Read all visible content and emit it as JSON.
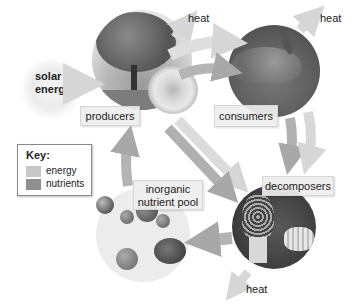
{
  "diagram": {
    "source_label": {
      "line1": "solar",
      "line2": "energy"
    },
    "nodes": {
      "producers": {
        "label": "producers"
      },
      "consumers": {
        "label": "consumers"
      },
      "decomposers": {
        "label": "decomposers"
      },
      "nutrient_pool": {
        "line1": "inorganic",
        "line2": "nutrient pool"
      }
    },
    "heat_labels": [
      "heat",
      "heat",
      "heat"
    ],
    "key": {
      "title": "Key:",
      "items": [
        {
          "label": "energy",
          "color": "#c8c8c8"
        },
        {
          "label": "nutrients",
          "color": "#8f8f8f"
        }
      ]
    },
    "colors": {
      "energy_arrow": "#d4d4d4",
      "nutrient_arrow": "#a3a3a3",
      "label_box": "#eeeeee"
    }
  }
}
